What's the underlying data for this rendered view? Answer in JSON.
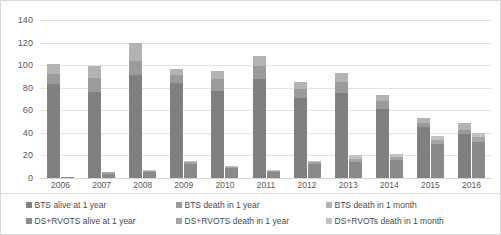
{
  "chart_data": {
    "type": "bar",
    "title": "",
    "xlabel": "",
    "ylabel": "",
    "ylim": [
      0,
      140
    ],
    "ytick_step": 20,
    "grid": true,
    "legend_position": "bottom",
    "stacked": true,
    "grouped_pairs": true,
    "categories": [
      "2006",
      "2007",
      "2008",
      "2009",
      "2010",
      "2011",
      "2012",
      "2013",
      "2014",
      "2015",
      "2016"
    ],
    "yticks": [
      "0",
      "20",
      "40",
      "60",
      "80",
      "100",
      "120",
      "140"
    ],
    "series": [
      {
        "name": "BTS alive at 1 year",
        "group": "BTS",
        "color": "#808080",
        "values": [
          83,
          76,
          91,
          84,
          77,
          88,
          71,
          75,
          61,
          45,
          39
        ]
      },
      {
        "name": "BTS death in 1 year",
        "group": "BTS",
        "color": "#9b9b9b",
        "values": [
          9,
          13,
          13,
          7,
          11,
          11,
          8,
          10,
          7,
          4,
          4
        ]
      },
      {
        "name": "BTS death in 1 month",
        "group": "BTS",
        "color": "#b3b3b3",
        "values": [
          9,
          10,
          16,
          6,
          7,
          9,
          6,
          8,
          6,
          4,
          6
        ]
      },
      {
        "name": "DS+RVOTS alive at 1 year",
        "group": "DS+RVOTs",
        "color": "#8a8a8a",
        "values": [
          1,
          4,
          5,
          12,
          9,
          5,
          12,
          14,
          16,
          30,
          32
        ]
      },
      {
        "name": "DS+RVOTS death in 1 year",
        "group": "DS+RVOTs",
        "color": "#a5a5a5",
        "values": [
          0,
          1,
          1,
          2,
          1,
          1,
          2,
          3,
          3,
          4,
          4
        ]
      },
      {
        "name": "DS+RVOTs death in 1 month",
        "group": "DS+RVOTs",
        "color": "#c2c2c2",
        "values": [
          0,
          0,
          1,
          1,
          1,
          1,
          1,
          3,
          2,
          3,
          4
        ]
      }
    ],
    "group_totals": {
      "BTS": [
        101,
        99,
        120,
        97,
        95,
        108,
        85,
        93,
        74,
        53,
        49
      ],
      "DS+RVOTs": [
        1,
        5,
        7,
        15,
        11,
        7,
        15,
        20,
        21,
        37,
        40
      ]
    }
  },
  "legend": {
    "rows": [
      [
        {
          "label": "BTS alive at 1 year",
          "color": "#808080"
        },
        {
          "label": "BTS death in 1 year",
          "color": "#9b9b9b"
        },
        {
          "label": "BTS death in 1 month",
          "color": "#b3b3b3"
        }
      ],
      [
        {
          "label": "DS+RVOTS alive at 1 year",
          "color": "#8a8a8a"
        },
        {
          "label": "DS+RVOTS death in 1 year",
          "color": "#a5a5a5"
        },
        {
          "label": "DS+RVOTs death in 1 month",
          "color": "#c2c2c2"
        }
      ]
    ]
  },
  "style": {
    "plot_background": "#ffffff",
    "gridline_color": "#e4e4e4",
    "axis_text_color": "#595959",
    "border_color": "#d9d9d9"
  }
}
